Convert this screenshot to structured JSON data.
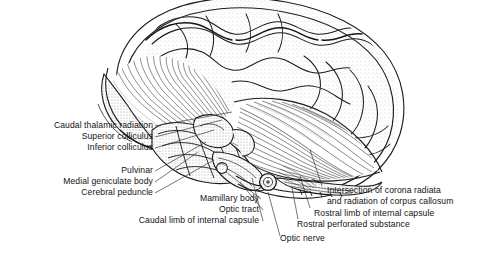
{
  "figure": {
    "kind": "anatomical-line-illustration",
    "style": "black ink stipple and hatching on white background",
    "ink_color": "#1a1a1a",
    "background_color": "#ffffff",
    "stipple_color": "#9a9a9a",
    "leader_line_color": "#2b2b2b"
  },
  "labels": {
    "left_group": [
      {
        "id": "caudal-thalamic-radiation",
        "text": "Caudal thalamic radiation"
      },
      {
        "id": "superior-colliculus",
        "text": "Superior colliculus"
      },
      {
        "id": "inferior-colliculus",
        "text": "Inferior colliculus"
      },
      {
        "id": "pulvinar",
        "text": "Pulvinar"
      },
      {
        "id": "medial-geniculate-body",
        "text": "Medial geniculate body"
      },
      {
        "id": "cerebral-peduncle",
        "text": "Cerebral peduncle"
      }
    ],
    "middle_group": [
      {
        "id": "mamillary-body",
        "text": "Mamillary body"
      },
      {
        "id": "optic-tract",
        "text": "Optic tract"
      },
      {
        "id": "caudal-limb-of-internal-capsule",
        "text": "Caudal limb of internal capsule"
      }
    ],
    "bottom_center": [
      {
        "id": "optic-nerve",
        "text": "Optic nerve"
      }
    ],
    "right_group": [
      {
        "id": "intersection-of-corona-radiata",
        "text": "Intersection of corona radiata"
      },
      {
        "id": "and-radiation-of-corpus-callosum",
        "text": "and radiation of corpus callosum"
      },
      {
        "id": "rostral-limb-of-internal-capsule",
        "text": "Rostral limb of internal capsule"
      },
      {
        "id": "rostral-perforated-substance",
        "text": "Rostral perforated substance"
      }
    ]
  }
}
